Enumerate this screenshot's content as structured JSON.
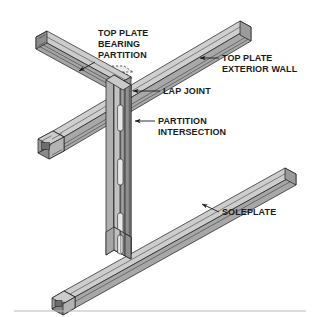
{
  "figure": {
    "type": "isometric-technical-diagram",
    "background_color": "#ffffff",
    "line_color": "#1a1a1a",
    "footer_rule_color": "#b9b9b9"
  },
  "palette": {
    "face_top_light": "#d2d2d2",
    "face_top": "#c6c6c6",
    "face_side_mid": "#a9a9a9",
    "face_side_dark": "#8d8d8d",
    "face_end": "#9a9a9a",
    "face_shadow": "#787878",
    "web_light": "#bdbdbd",
    "web_dark": "#9f9f9f",
    "hatch_white": "#f2f2f2"
  },
  "labels": [
    {
      "id": "top-plate-bearing-partition",
      "lines": [
        "TOP PLATE",
        "BEARING",
        "PARTITION"
      ],
      "text_x": 98,
      "text_y": 36,
      "anchor": "start",
      "leader": "M 96 62 L 78 72",
      "arrow_at": [
        76,
        73
      ],
      "arrow_dir": "down-left"
    },
    {
      "id": "top-plate-exterior-wall",
      "lines": [
        "TOP PLATE",
        "EXTERIOR WALL"
      ],
      "text_x": 222,
      "text_y": 61,
      "anchor": "start",
      "leader": "M 219 58 L 201 58",
      "arrow_at": [
        198,
        58
      ],
      "arrow_dir": "left"
    },
    {
      "id": "lap-joint",
      "lines": [
        "LAP JOINT"
      ],
      "text_x": 163,
      "text_y": 94,
      "anchor": "start",
      "leader": "M 160 91 L 135 91",
      "arrow_at": [
        131,
        92
      ],
      "arrow_dir": "left"
    },
    {
      "id": "partition-intersection",
      "lines": [
        "PARTITION",
        "INTERSECTION"
      ],
      "text_x": 158,
      "text_y": 124,
      "anchor": "start",
      "leader": "M 155 121 L 137 121",
      "arrow_at": [
        133,
        121
      ],
      "arrow_dir": "left"
    },
    {
      "id": "soleplate",
      "lines": [
        "SOLEPLATE"
      ],
      "text_x": 222,
      "text_y": 215,
      "anchor": "start",
      "leader": "M 219 212 L 203 205",
      "arrow_at": [
        200,
        203
      ],
      "arrow_dir": "up-left"
    }
  ],
  "parts": [
    {
      "id": "bearing-partition-top-plate",
      "name": "Top plate of bearing partition",
      "orientation": "upper-left diagonal beam"
    },
    {
      "id": "exterior-wall-top-plate",
      "name": "Top plate of exterior wall",
      "orientation": "upper-right to lower-left diagonal beam"
    },
    {
      "id": "lap-joint-region",
      "name": "Lap joint (hidden/dashed overlap)",
      "orientation": "center, beneath beam crossing"
    },
    {
      "id": "partition-studs",
      "name": "Partition intersection studs with web knockouts",
      "orientation": "vertical column"
    },
    {
      "id": "soleplate-beam",
      "name": "Soleplate",
      "orientation": "lower-right to lower-left diagonal beam"
    }
  ],
  "stud_knockouts": [
    {
      "index": 1,
      "y": 118
    },
    {
      "index": 2,
      "y": 172
    },
    {
      "index": 3,
      "y": 226
    }
  ]
}
